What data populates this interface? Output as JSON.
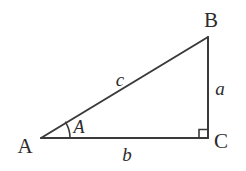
{
  "figure": {
    "kind": "right-triangle-diagram",
    "background_color": "#ffffff",
    "stroke_color": "#3a3a3a",
    "text_color": "#2b2b2b",
    "width": 246,
    "height": 171
  },
  "vertices": [
    {
      "name": "A",
      "label": "A",
      "x": 41,
      "y": 138,
      "label_x": 25,
      "label_y": 146,
      "role": "acute-angle-vertex"
    },
    {
      "name": "B",
      "label": "B",
      "x": 208,
      "y": 37,
      "label_x": 211,
      "label_y": 20,
      "role": "acute-angle-vertex"
    },
    {
      "name": "C",
      "label": "C",
      "x": 208,
      "y": 138,
      "label_x": 221,
      "label_y": 141,
      "role": "right-angle-vertex"
    }
  ],
  "sides": [
    {
      "name": "a",
      "label": "a",
      "from": "B",
      "to": "C",
      "label_x": 220,
      "label_y": 88,
      "description": "opposite side, vertical leg"
    },
    {
      "name": "b",
      "label": "b",
      "from": "A",
      "to": "C",
      "label_x": 127,
      "label_y": 154,
      "description": "adjacent side, horizontal leg"
    },
    {
      "name": "c",
      "label": "c",
      "from": "A",
      "to": "B",
      "label_x": 120,
      "label_y": 79,
      "description": "hypotenuse"
    }
  ],
  "angles": [
    {
      "name": "A",
      "label": "A",
      "at_vertex": "A",
      "label_x": 79,
      "label_y": 127,
      "arc_radius": 29,
      "marker": "arc"
    },
    {
      "name": "C",
      "label": "",
      "at_vertex": "C",
      "marker": "right-angle-square",
      "square_size": 8
    }
  ],
  "geometry": {
    "hypotenuse_path": "M 41 138 L 208 37",
    "vertical_leg_path": "M 208 37 L 208 138",
    "base_leg_path": "M 41 138 L 208 138",
    "angle_arc_path": "M 70 138 A 29 29 0 0 0 65.4 122.4",
    "right_angle_square_path": "M 200 138 L 200 130 L 208 130",
    "stroke_width": 2
  }
}
